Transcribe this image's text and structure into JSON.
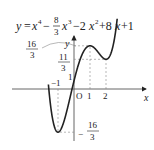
{
  "equation": {
    "lhs": "y",
    "eq": "=",
    "t1": "x",
    "t1_exp": "4",
    "minus1": "−",
    "frac_num": "8",
    "frac_den": "3",
    "t2": "x",
    "t2_exp": "3",
    "rest1": "−2",
    "t3": "x",
    "t3_exp": "2",
    "rest2": "+8",
    "t4": "x",
    "rest3": "+1"
  },
  "axes": {
    "x_label": "x",
    "y_label": "y",
    "origin_label": "O",
    "x_ticks": [
      {
        "value": 1,
        "label": "1"
      },
      {
        "value": 2,
        "label": "2"
      }
    ],
    "neg_x_label": "−1",
    "y_intercept_label": "1"
  },
  "labels": {
    "max_num": "16",
    "max_den": "3",
    "local_min2_num": "11",
    "local_min2_den": "3",
    "min_sign": "−",
    "min_num": "16",
    "min_den": "3"
  },
  "chart_data": {
    "type": "line",
    "function": "x^4 - 8/3*x^3 - 2*x^2 + 8*x + 1",
    "xlabel": "x",
    "ylabel": "y",
    "xlim": [
      -1.6,
      2.7
    ],
    "ylim": [
      -6.3,
      9.5
    ],
    "critical_points": [
      {
        "x": -1,
        "y": -5.3333,
        "kind": "local minimum",
        "label": "-16/3"
      },
      {
        "x": 1,
        "y": 5.3333,
        "kind": "local maximum",
        "label": "16/3"
      },
      {
        "x": 2,
        "y": 3.6667,
        "kind": "local minimum",
        "label": "11/3"
      }
    ],
    "y_intercept": 1,
    "grid": false
  }
}
